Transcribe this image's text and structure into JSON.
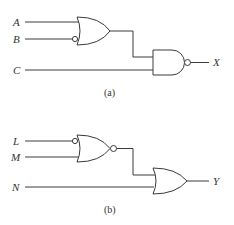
{
  "circuits": [
    {
      "id": "a",
      "caption": "(a)",
      "inputs": [
        {
          "label": "A",
          "inverted": false
        },
        {
          "label": "B",
          "inverted": true
        },
        {
          "label": "C",
          "inverted": false
        }
      ],
      "gate1": {
        "type": "OR",
        "inputs": [
          "A",
          "B"
        ],
        "inverted_inputs": [
          "B"
        ],
        "output_inverted": false
      },
      "gate2": {
        "type": "NAND",
        "inputs": [
          "gate1",
          "C"
        ],
        "output_inverted": true
      },
      "output": "X"
    },
    {
      "id": "b",
      "caption": "(b)",
      "inputs": [
        {
          "label": "L",
          "inverted": true
        },
        {
          "label": "M",
          "inverted": false
        },
        {
          "label": "N",
          "inverted": false
        }
      ],
      "gate1": {
        "type": "NOR",
        "inputs": [
          "L",
          "M"
        ],
        "inverted_inputs": [
          "L"
        ],
        "output_inverted": true
      },
      "gate2": {
        "type": "OR",
        "inputs": [
          "gate1",
          "N"
        ],
        "output_inverted": false
      },
      "output": "Y"
    }
  ]
}
